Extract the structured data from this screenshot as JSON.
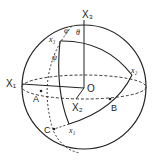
{
  "labels": {
    "X3": "X₃",
    "X1": "X₁",
    "X2": "X₂",
    "O": "O",
    "A": "A",
    "B": "B",
    "C": "C",
    "x1": "x₁",
    "x2": "x₂",
    "x3": "x₃",
    "phi": "φ",
    "theta": "θ",
    "psi": "ψ"
  }
}
